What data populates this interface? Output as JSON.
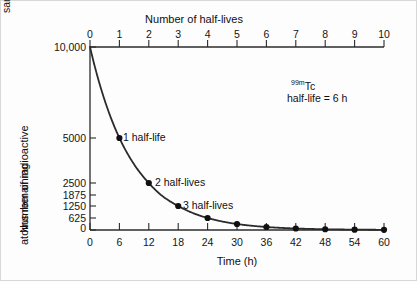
{
  "figure": {
    "background": "#fdfdfd",
    "line_color": "#2b2b2b",
    "marker_color": "#101010"
  },
  "top_axis": {
    "title": "Number of half-lives",
    "ticks": [
      "0",
      "1",
      "2",
      "3",
      "4",
      "5",
      "6",
      "7",
      "8",
      "9",
      "10"
    ]
  },
  "bottom_axis": {
    "title": "Time (h)",
    "ticks": [
      "0",
      "6",
      "12",
      "18",
      "24",
      "30",
      "36",
      "42",
      "48",
      "54",
      "60"
    ]
  },
  "y_axis": {
    "label_line1": "Number of radioactive",
    "label_line2": "atoms remaining",
    "ticks": [
      "10,000",
      "5000",
      "2500",
      "1875",
      "1250",
      "625",
      "0"
    ]
  },
  "initial_sample": {
    "line1": "Initial",
    "line2": "sample"
  },
  "isotope_note": {
    "superscript": "99m",
    "element": "Tc",
    "halflife_text": "half-life = 6 h"
  },
  "callouts": [
    {
      "text": "1 half-life"
    },
    {
      "text": "2 half-lives"
    },
    {
      "text": "3 half-lives"
    }
  ],
  "chart_data": {
    "type": "line",
    "title": "",
    "subtitle": "",
    "xlabel": "Time (h)",
    "ylabel": "Number of radioactive atoms remaining",
    "secondary_xlabel": "Number of half-lives",
    "grid": false,
    "legend": "none",
    "xlim": [
      0,
      60
    ],
    "ylim": [
      0,
      10000
    ],
    "secondary_xlim": [
      0,
      10
    ],
    "xticks": [
      0,
      6,
      12,
      18,
      24,
      30,
      36,
      42,
      48,
      54,
      60
    ],
    "secondary_xticks": [
      0,
      1,
      2,
      3,
      4,
      5,
      6,
      7,
      8,
      9,
      10
    ],
    "yticks": [
      0,
      625,
      1250,
      1875,
      2500,
      5000,
      10000
    ],
    "ytick_labels": [
      "0",
      "625",
      "1250",
      "1875",
      "2500",
      "5000",
      "10,000"
    ],
    "series": [
      {
        "name": "99mTc radioactive atoms remaining",
        "x": [
          0,
          6,
          12,
          18,
          24,
          30,
          36,
          42,
          48,
          54,
          60
        ],
        "half_lives": [
          0,
          1,
          2,
          3,
          4,
          5,
          6,
          7,
          8,
          9,
          10
        ],
        "values": [
          10000,
          5000,
          2500,
          1250,
          625,
          312.5,
          156.25,
          78.125,
          39.0625,
          19.53125,
          9.765625
        ],
        "markers": true
      }
    ],
    "annotations": [
      {
        "text": "1 half-life",
        "x": 6,
        "y": 5000
      },
      {
        "text": "2 half-lives",
        "x": 12,
        "y": 2500
      },
      {
        "text": "3 half-lives",
        "x": 18,
        "y": 1250
      },
      {
        "text": "99mTc half-life = 6 h",
        "x": 36,
        "y": 8000
      },
      {
        "text": "Initial sample",
        "x": 0,
        "y": 10000
      }
    ]
  }
}
